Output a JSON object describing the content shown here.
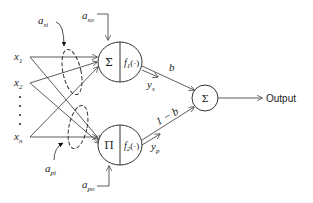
{
  "diagram": {
    "type": "neural-network-node-diagram",
    "inputs": [
      {
        "label": "x",
        "sub": "1"
      },
      {
        "label": "x",
        "sub": "2"
      },
      {
        "label": "x",
        "sub": "n"
      }
    ],
    "ellipsis": "⋮",
    "upper_node": {
      "op": "Σ",
      "func": "f",
      "func_sub": "1",
      "func_arg": "(·)",
      "weight_in": {
        "label": "a",
        "sub": "si"
      },
      "weight_out": {
        "label": "a",
        "sub": "so"
      },
      "output": {
        "label": "y",
        "sub": "s"
      }
    },
    "lower_node": {
      "op": "Π",
      "func": "f",
      "func_sub": "2",
      "func_arg": "(·)",
      "weight_in": {
        "label": "a",
        "sub": "pi"
      },
      "weight_out": {
        "label": "a",
        "sub": "po"
      },
      "output": {
        "label": "y",
        "sub": "p"
      }
    },
    "upper_edge_weight": "b",
    "lower_edge_weight": "1 − b",
    "sum_node": {
      "op": "Σ"
    },
    "output_label": "Output"
  }
}
